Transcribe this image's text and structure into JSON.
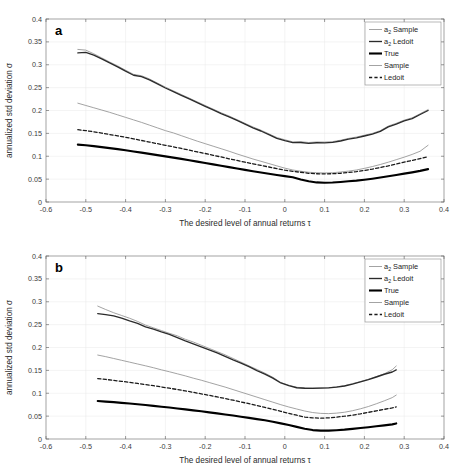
{
  "figure": {
    "width": 461,
    "height": 474,
    "background": "#ffffff"
  },
  "colors": {
    "a2_sample": "#8c8c8c",
    "a2_ledoit": "#2b2b2b",
    "true": "#000000",
    "sample": "#8c8c8c",
    "ledoit": "#1a1a1a",
    "grid": "#e8e8e8",
    "axis": "#7d7d7d",
    "tick_text": "#3a3a3a"
  },
  "chart_data": [
    {
      "type": "line",
      "panel_label": "a",
      "title": "",
      "xlabel": "The desired level of annual returns τ",
      "ylabel": "annualized std deviation σ",
      "xlim": [
        -0.6,
        0.4
      ],
      "ylim": [
        0,
        0.4
      ],
      "xticks": [
        -0.6,
        -0.5,
        -0.4,
        -0.3,
        -0.2,
        -0.1,
        0,
        0.1,
        0.2,
        0.3,
        0.4
      ],
      "xtick_labels": [
        "-0.6",
        "-0.5",
        "-0.4",
        "-0.3",
        "-0.2",
        "-0.1",
        "0",
        "0.1",
        "0.2",
        "0.3",
        "0.4"
      ],
      "yticks": [
        0,
        0.05,
        0.1,
        0.15,
        0.2,
        0.25,
        0.3,
        0.35,
        0.4
      ],
      "ytick_labels": [
        "0",
        "0.05",
        "0.1",
        "0.15",
        "0.2",
        "0.25",
        "0.3",
        "0.35",
        "0.4"
      ],
      "grid": true,
      "legend_position": "top-right",
      "x": [
        -0.52,
        -0.5,
        -0.48,
        -0.46,
        -0.44,
        -0.42,
        -0.4,
        -0.38,
        -0.36,
        -0.34,
        -0.32,
        -0.3,
        -0.28,
        -0.26,
        -0.24,
        -0.22,
        -0.2,
        -0.18,
        -0.16,
        -0.14,
        -0.12,
        -0.1,
        -0.08,
        -0.06,
        -0.04,
        -0.02,
        0.0,
        0.02,
        0.04,
        0.06,
        0.08,
        0.1,
        0.12,
        0.14,
        0.16,
        0.18,
        0.2,
        0.22,
        0.24,
        0.26,
        0.28,
        0.3,
        0.32,
        0.34,
        0.36
      ],
      "series": [
        {
          "name": "a_2 Sample",
          "style": "thin-solid-gray",
          "values": [
            0.3335,
            0.332,
            0.324,
            0.315,
            0.306,
            0.2975,
            0.288,
            0.279,
            0.276,
            0.269,
            0.26,
            0.251,
            0.243,
            0.235,
            0.227,
            0.219,
            0.211,
            0.203,
            0.195,
            0.188,
            0.18,
            0.172,
            0.164,
            0.157,
            0.149,
            0.141,
            0.136,
            0.1315,
            0.1318,
            0.13,
            0.1312,
            0.131,
            0.132,
            0.135,
            0.139,
            0.142,
            0.146,
            0.15,
            0.156,
            0.166,
            0.172,
            0.179,
            0.184,
            0.193,
            0.202
          ]
        },
        {
          "name": "a_2 Ledoit",
          "style": "medium-solid-dark",
          "values": [
            0.326,
            0.327,
            0.321,
            0.313,
            0.304,
            0.2955,
            0.286,
            0.277,
            0.274,
            0.267,
            0.258,
            0.2492,
            0.2412,
            0.2332,
            0.2252,
            0.2172,
            0.2092,
            0.2012,
            0.1932,
            0.1862,
            0.1782,
            0.1702,
            0.1622,
            0.1552,
            0.1472,
            0.1392,
            0.1342,
            0.1298,
            0.13,
            0.1283,
            0.1295,
            0.1293,
            0.1303,
            0.1333,
            0.1373,
            0.1403,
            0.1443,
            0.1483,
            0.1543,
            0.1643,
            0.1703,
            0.1773,
            0.1823,
            0.1913,
            0.2
          ]
        },
        {
          "name": "Sample",
          "style": "thin-solid-gray",
          "values": [
            0.216,
            0.211,
            0.206,
            0.201,
            0.196,
            0.1905,
            0.185,
            0.1795,
            0.174,
            0.168,
            0.162,
            0.156,
            0.151,
            0.145,
            0.139,
            0.133,
            0.1275,
            0.122,
            0.1165,
            0.111,
            0.105,
            0.0995,
            0.094,
            0.089,
            0.084,
            0.079,
            0.074,
            0.07,
            0.0672,
            0.065,
            0.064,
            0.0635,
            0.064,
            0.0655,
            0.0675,
            0.07,
            0.0735,
            0.0775,
            0.082,
            0.087,
            0.0925,
            0.098,
            0.104,
            0.111,
            0.124
          ]
        },
        {
          "name": "Ledoit",
          "style": "dashed-dark",
          "values": [
            0.158,
            0.156,
            0.1535,
            0.1505,
            0.1475,
            0.1445,
            0.1415,
            0.138,
            0.1345,
            0.131,
            0.1275,
            0.124,
            0.1205,
            0.117,
            0.1135,
            0.1095,
            0.106,
            0.102,
            0.0985,
            0.0945,
            0.091,
            0.087,
            0.0835,
            0.08,
            0.0765,
            0.073,
            0.0695,
            0.067,
            0.065,
            0.0628,
            0.0618,
            0.0615,
            0.0618,
            0.0628,
            0.0645,
            0.0665,
            0.069,
            0.072,
            0.0755,
            0.079,
            0.083,
            0.087,
            0.091,
            0.095,
            0.099
          ]
        },
        {
          "name": "True",
          "style": "thick-solid-black",
          "values": [
            0.1255,
            0.124,
            0.1222,
            0.12,
            0.1178,
            0.1155,
            0.113,
            0.1105,
            0.108,
            0.1052,
            0.1025,
            0.0998,
            0.097,
            0.0942,
            0.0912,
            0.0882,
            0.0852,
            0.0822,
            0.0792,
            0.0762,
            0.0732,
            0.0702,
            0.0672,
            0.0645,
            0.0618,
            0.059,
            0.0565,
            0.054,
            0.0492,
            0.0452,
            0.0428,
            0.042,
            0.0425,
            0.0438,
            0.0452,
            0.0468,
            0.0488,
            0.051,
            0.0535,
            0.0562,
            0.059,
            0.062,
            0.0648,
            0.068,
            0.0718
          ]
        }
      ]
    },
    {
      "type": "line",
      "panel_label": "b",
      "title": "",
      "xlabel": "The desired level of annual returns τ",
      "ylabel": "annualized std deviation σ",
      "xlim": [
        -0.6,
        0.4
      ],
      "ylim": [
        0,
        0.4
      ],
      "xticks": [
        -0.6,
        -0.5,
        -0.4,
        -0.3,
        -0.2,
        -0.1,
        0,
        0.1,
        0.2,
        0.3,
        0.4
      ],
      "xtick_labels": [
        "-0.6",
        "-0.5",
        "-0.4",
        "-0.3",
        "-0.2",
        "-0.1",
        "0",
        "0.1",
        "0.2",
        "0.3",
        "0.4"
      ],
      "yticks": [
        0,
        0.05,
        0.1,
        0.15,
        0.2,
        0.25,
        0.3,
        0.35,
        0.4
      ],
      "ytick_labels": [
        "0",
        "0.05",
        "0.1",
        "0.15",
        "0.2",
        "0.25",
        "0.3",
        "0.35",
        "0.4"
      ],
      "grid": true,
      "legend_position": "top-right",
      "x": [
        -0.47,
        -0.45,
        -0.43,
        -0.41,
        -0.39,
        -0.37,
        -0.35,
        -0.33,
        -0.31,
        -0.29,
        -0.27,
        -0.25,
        -0.23,
        -0.21,
        -0.19,
        -0.17,
        -0.15,
        -0.13,
        -0.11,
        -0.09,
        -0.07,
        -0.05,
        -0.03,
        -0.01,
        0.01,
        0.03,
        0.05,
        0.07,
        0.09,
        0.11,
        0.13,
        0.15,
        0.17,
        0.19,
        0.21,
        0.23,
        0.25,
        0.27,
        0.28
      ],
      "series": [
        {
          "name": "a_2 Sample",
          "style": "thin-solid-gray",
          "values": [
            0.2905,
            0.283,
            0.276,
            0.27,
            0.264,
            0.257,
            0.249,
            0.243,
            0.237,
            0.231,
            0.2255,
            0.218,
            0.212,
            0.205,
            0.198,
            0.191,
            0.184,
            0.176,
            0.168,
            0.16,
            0.152,
            0.144,
            0.135,
            0.1235,
            0.1175,
            0.113,
            0.1118,
            0.1115,
            0.1118,
            0.1122,
            0.114,
            0.1165,
            0.121,
            0.1255,
            0.1305,
            0.1365,
            0.1425,
            0.1515,
            0.1595
          ]
        },
        {
          "name": "a_2 Ledoit",
          "style": "medium-solid-dark",
          "values": [
            0.274,
            0.272,
            0.269,
            0.264,
            0.258,
            0.2525,
            0.245,
            0.24,
            0.234,
            0.2285,
            0.2215,
            0.2145,
            0.208,
            0.2015,
            0.195,
            0.188,
            0.1805,
            0.173,
            0.166,
            0.158,
            0.1495,
            0.142,
            0.133,
            0.1225,
            0.1165,
            0.112,
            0.111,
            0.1108,
            0.1112,
            0.1118,
            0.1135,
            0.1158,
            0.12,
            0.1248,
            0.1298,
            0.1355,
            0.1415,
            0.1465,
            0.151
          ]
        },
        {
          "name": "Sample",
          "style": "thin-solid-gray",
          "values": [
            0.1835,
            0.18,
            0.176,
            0.172,
            0.168,
            0.164,
            0.16,
            0.1558,
            0.1512,
            0.147,
            0.1425,
            0.138,
            0.133,
            0.1285,
            0.1235,
            0.1185,
            0.1135,
            0.108,
            0.1025,
            0.097,
            0.0915,
            0.086,
            0.0805,
            0.075,
            0.07,
            0.0655,
            0.0612,
            0.0578,
            0.056,
            0.0555,
            0.0565,
            0.0585,
            0.0618,
            0.066,
            0.071,
            0.077,
            0.0835,
            0.0905,
            0.096
          ]
        },
        {
          "name": "Ledoit",
          "style": "dashed-dark",
          "values": [
            0.132,
            0.1302,
            0.1282,
            0.126,
            0.1238,
            0.1215,
            0.119,
            0.1165,
            0.1138,
            0.111,
            0.1082,
            0.1052,
            0.102,
            0.0988,
            0.0955,
            0.092,
            0.0885,
            0.0848,
            0.081,
            0.0772,
            0.073,
            0.069,
            0.0648,
            0.0605,
            0.0562,
            0.052,
            0.048,
            0.0462,
            0.0455,
            0.0462,
            0.0478,
            0.0498,
            0.0522,
            0.055,
            0.0582,
            0.0615,
            0.0648,
            0.068,
            0.07
          ]
        },
        {
          "name": "True",
          "style": "thick-solid-black",
          "values": [
            0.083,
            0.0818,
            0.0805,
            0.079,
            0.0775,
            0.076,
            0.0742,
            0.0725,
            0.0705,
            0.0688,
            0.0668,
            0.0648,
            0.0625,
            0.0605,
            0.0582,
            0.056,
            0.0535,
            0.0512,
            0.0488,
            0.0462,
            0.0435,
            0.0408,
            0.0378,
            0.0342,
            0.0305,
            0.0265,
            0.0225,
            0.0195,
            0.0182,
            0.0182,
            0.0192,
            0.0205,
            0.0222,
            0.024,
            0.0258,
            0.0278,
            0.0298,
            0.032,
            0.034
          ]
        }
      ]
    }
  ],
  "legend": {
    "entries": [
      {
        "label": "Sample",
        "sub": "2",
        "prefix": "a",
        "style": "thin-solid-gray"
      },
      {
        "label": "Ledoit",
        "sub": "2",
        "prefix": "a",
        "style": "medium-solid-dark"
      },
      {
        "label": "True",
        "sub": "",
        "prefix": "",
        "style": "thick-solid-black"
      },
      {
        "label": "Sample",
        "sub": "",
        "prefix": "",
        "style": "thin-solid-gray"
      },
      {
        "label": "Ledoit",
        "sub": "",
        "prefix": "",
        "style": "dashed-dark"
      }
    ]
  }
}
